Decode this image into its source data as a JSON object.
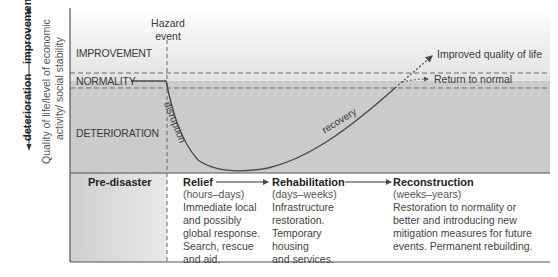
{
  "axis": {
    "label_line1": "Quality of life/level of economic",
    "label_line2": "activity/ social stability",
    "up_label": "improvement",
    "down_label": "deterioration"
  },
  "bands": {
    "improvement": "IMPROVEMENT",
    "normality": "NORMALITY",
    "deterioration": "DETERIORATION"
  },
  "hazard_event": {
    "line1": "Hazard",
    "line2": "event"
  },
  "curve_labels": {
    "disruption": "disruption",
    "recovery": "recovery"
  },
  "outcomes": {
    "improved": "Improved quality of life",
    "normal": "Return to normal"
  },
  "phases": [
    {
      "title": "Pre-disaster",
      "time": "",
      "lines": []
    },
    {
      "title": "Relief",
      "time": "(hours–days)",
      "lines": [
        "Immediate local",
        "and possibly",
        "global response.",
        "Search, rescue",
        "and aid."
      ]
    },
    {
      "title": "Rehabilitation",
      "time": "(days–weeks)",
      "lines": [
        "Infrastructure",
        "restoration.",
        "Temporary",
        "housing",
        "and services."
      ]
    },
    {
      "title": "Reconstruction",
      "time": "(weeks–years)",
      "lines": [
        "Restoration to normality or",
        "better and introducing new",
        "mitigation measures for future",
        "events. Permanent rebuilding."
      ]
    }
  ],
  "colors": {
    "band_dark": "#c9c9c9",
    "band_light": "#f2f2f2",
    "line": "#4a4a4a",
    "dash": "#6b6b6b",
    "predisaster_bg": "#cdcdcd"
  }
}
